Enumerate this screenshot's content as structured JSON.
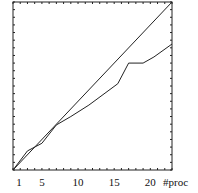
{
  "chart_data": {
    "type": "line",
    "title": "",
    "xlabel": "#proc",
    "ylabel": "",
    "xlim": [
      1,
      23
    ],
    "ylim": [
      1,
      23
    ],
    "grid": false,
    "legend": null,
    "x_ticks": [
      1,
      5,
      10,
      15,
      20
    ],
    "x_tick_labels": [
      "1",
      "5",
      "10",
      "15",
      "20"
    ],
    "series": [
      {
        "name": "ideal",
        "x": [
          1,
          23
        ],
        "values": [
          1,
          23
        ]
      },
      {
        "name": "measured",
        "x": [
          1,
          3,
          5,
          7,
          9,
          11.5,
          15.5,
          17,
          19,
          20.5,
          23
        ],
        "values": [
          1,
          3.5,
          4.5,
          6.9,
          8,
          9.5,
          12.3,
          15,
          15,
          15.8,
          17.5
        ]
      }
    ]
  }
}
